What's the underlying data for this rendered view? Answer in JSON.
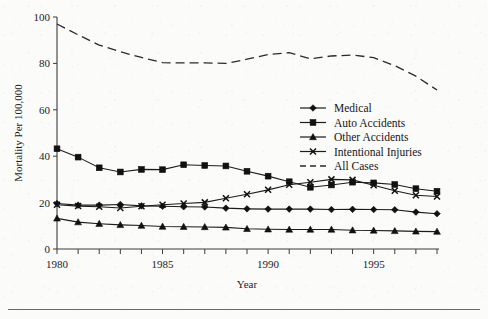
{
  "figure": {
    "background_color": "#fbfbfa",
    "ink_color": "#1c1c1c",
    "has_bottom_rule": true
  },
  "axes": {
    "x_title": "Year",
    "y_title": "Mortality Per 100,000",
    "x_tick_labels": [
      "1980",
      "1985",
      "1990",
      "1995"
    ],
    "y_tick_labels": [
      "0",
      "20",
      "40",
      "60",
      "80",
      "100"
    ]
  },
  "legend": {
    "position": "center-right",
    "entries": [
      {
        "label": "Medical",
        "marker": "diamond",
        "style": "solid"
      },
      {
        "label": "Auto Accidents",
        "marker": "square",
        "style": "solid"
      },
      {
        "label": "Other Accidents",
        "marker": "triangle",
        "style": "solid"
      },
      {
        "label": "Intentional Injuries",
        "marker": "x",
        "style": "solid"
      },
      {
        "label": "All Cases",
        "marker": "none",
        "style": "dashed"
      }
    ]
  },
  "chart_data": {
    "type": "line",
    "title": "",
    "xlabel": "Year",
    "ylabel": "Mortality Per 100,000",
    "xlim": [
      1980,
      1998
    ],
    "ylim": [
      0,
      100
    ],
    "x_ticks": [
      1980,
      1985,
      1990,
      1995
    ],
    "y_ticks": [
      0,
      20,
      40,
      60,
      80,
      100
    ],
    "grid": false,
    "legend_position": "center-right",
    "x": [
      1980,
      1981,
      1982,
      1983,
      1984,
      1985,
      1986,
      1987,
      1988,
      1989,
      1990,
      1991,
      1992,
      1993,
      1994,
      1995,
      1996,
      1997,
      1998
    ],
    "series": [
      {
        "name": "Medical",
        "marker": "diamond",
        "style": "solid",
        "values": [
          19.6,
          18.9,
          18.9,
          19.2,
          18.6,
          18.4,
          18.2,
          18.1,
          17.6,
          17.3,
          17.2,
          17.2,
          17.2,
          17.0,
          17.1,
          17.0,
          16.9,
          15.9,
          15.2
        ]
      },
      {
        "name": "Auto Accidents",
        "marker": "square",
        "style": "solid",
        "values": [
          43.2,
          39.6,
          35.0,
          33.2,
          34.3,
          34.2,
          36.3,
          36.0,
          35.8,
          33.5,
          31.4,
          29.0,
          26.6,
          27.6,
          28.8,
          28.5,
          27.8,
          26.0,
          24.9
        ]
      },
      {
        "name": "Other Accidents",
        "marker": "triangle",
        "style": "solid",
        "values": [
          13.2,
          11.6,
          10.9,
          10.4,
          10.1,
          9.7,
          9.6,
          9.5,
          9.3,
          8.7,
          8.5,
          8.4,
          8.4,
          8.4,
          8.1,
          8.0,
          7.8,
          7.6,
          7.5
        ]
      },
      {
        "name": "Intentional Injuries",
        "marker": "x",
        "style": "solid",
        "values": [
          19.1,
          18.5,
          18.2,
          17.7,
          18.4,
          19.1,
          19.6,
          20.1,
          21.9,
          23.6,
          25.5,
          27.7,
          28.8,
          30.0,
          29.8,
          27.5,
          25.1,
          23.2,
          22.6
        ]
      },
      {
        "name": "All Cases",
        "marker": "none",
        "style": "dashed",
        "values": [
          97.0,
          92.3,
          87.9,
          85.0,
          82.6,
          80.3,
          80.2,
          80.2,
          80.0,
          81.8,
          83.8,
          84.6,
          82.0,
          83.2,
          83.6,
          82.5,
          79.0,
          74.5,
          68.5
        ]
      }
    ]
  }
}
